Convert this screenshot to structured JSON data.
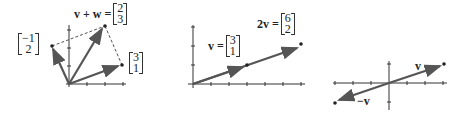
{
  "panel1": {
    "sum_label": "v + w =",
    "sum": [
      "2",
      "3"
    ],
    "w": [
      "−1",
      "2"
    ],
    "v": [
      "3",
      "1"
    ]
  },
  "panel2": {
    "v_label": "v =",
    "v": [
      "3",
      "1"
    ],
    "twov_label": "2v =",
    "twov": [
      "6",
      "2"
    ]
  },
  "panel3": {
    "v_label": "v",
    "negv_label": "−v"
  },
  "colors": {
    "vector": "#555555",
    "axis": "#333333"
  }
}
